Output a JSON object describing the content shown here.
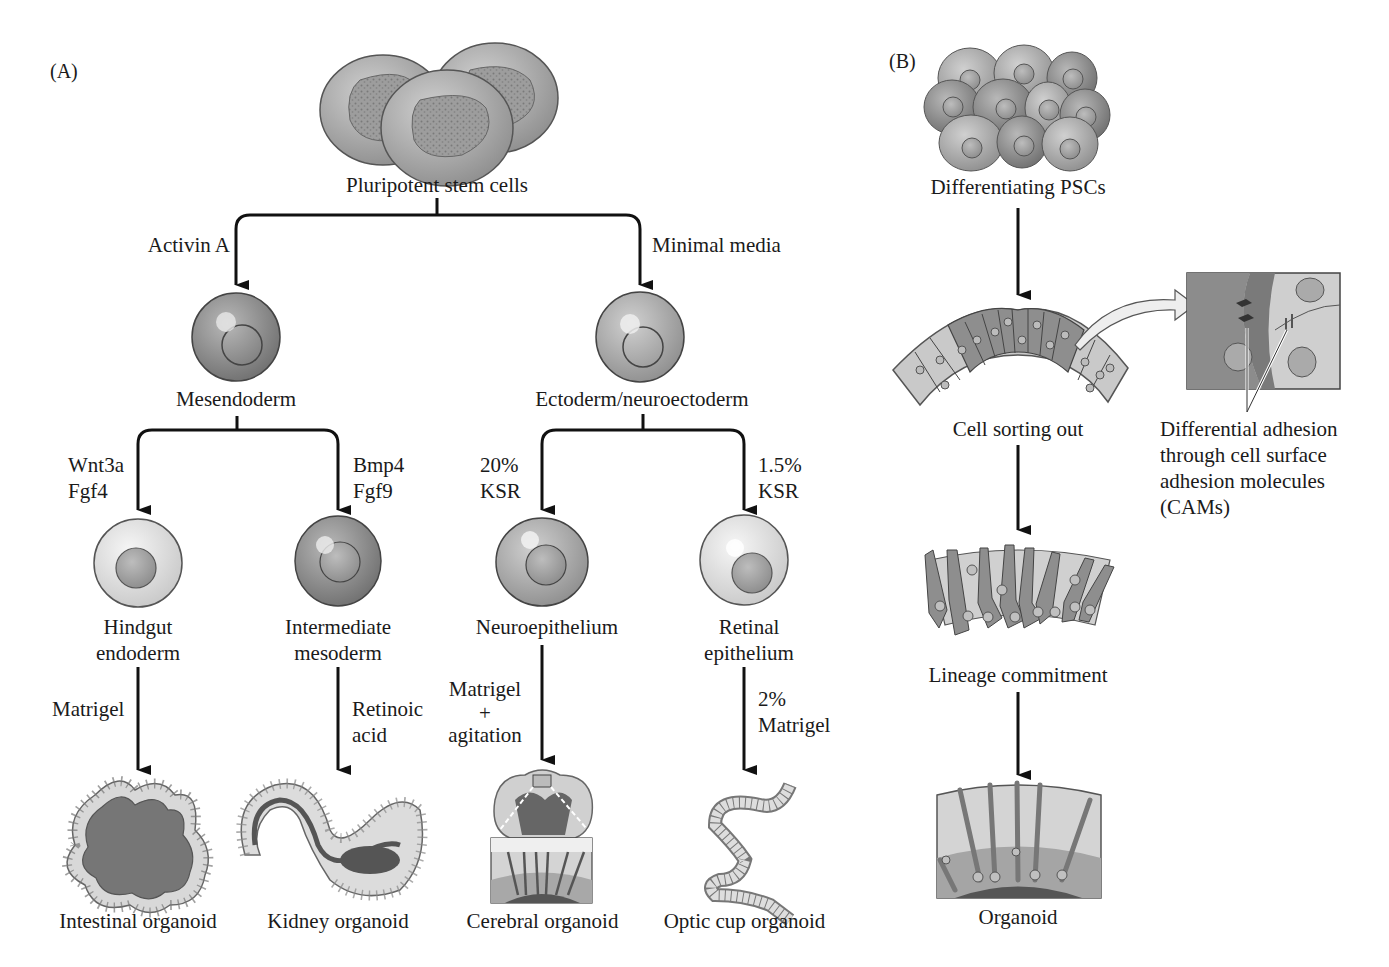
{
  "panel_a": {
    "label": "(A)",
    "root": {
      "label": "Pluripotent stem cells"
    },
    "branch_left": {
      "condition": "Activin A",
      "node": "Mesendoderm",
      "children": [
        {
          "condition_line1": "Wnt3a",
          "condition_line2": "Fgf4",
          "node_line1": "Hindgut",
          "node_line2": "endoderm",
          "step_condition_line1": "Matrigel",
          "step_condition_line2": "",
          "result": "Intestinal organoid"
        },
        {
          "condition_line1": "Bmp4",
          "condition_line2": "Fgf9",
          "node_line1": "Intermediate",
          "node_line2": "mesoderm",
          "step_condition_line1": "Retinoic",
          "step_condition_line2": "acid",
          "result": "Kidney organoid"
        }
      ]
    },
    "branch_right": {
      "condition": "Minimal media",
      "node": "Ectoderm/neuroectoderm",
      "children": [
        {
          "condition_line1": "20%",
          "condition_line2": "KSR",
          "node_line1": "Neuroepithelium",
          "node_line2": "",
          "step_condition_line1": "Matrigel",
          "step_condition_line2": "+",
          "step_condition_line3": "agitation",
          "result": "Cerebral organoid"
        },
        {
          "condition_line1": "1.5%",
          "condition_line2": "KSR",
          "node_line1": "Retinal",
          "node_line2": "epithelium",
          "step_condition_line1": "2%",
          "step_condition_line2": "Matrigel",
          "result": "Optic cup organoid"
        }
      ]
    }
  },
  "panel_b": {
    "label": "(B)",
    "steps": [
      "Differentiating PSCs",
      "Cell sorting out",
      "Lineage commitment",
      "Organoid"
    ],
    "callout": {
      "line1": "Differential adhesion",
      "line2": "through cell surface",
      "line3": "adhesion molecules",
      "line4": "(CAMs)"
    }
  },
  "colors": {
    "arrow": "#111111",
    "cell_dark": "#8a8a8a",
    "cell_mid": "#a8a8a8",
    "cell_light": "#d2d2d2",
    "cell_pale": "#e8e8e8",
    "lumen": "#6e6e6e"
  }
}
